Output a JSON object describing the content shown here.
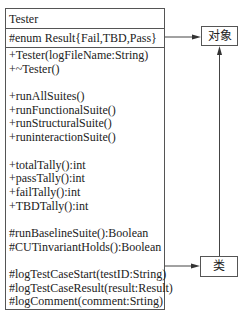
{
  "class_box": {
    "name": "Tester",
    "attributes": [
      "#enum Result{Fail,TBD,Pass}"
    ],
    "operation_groups": [
      [
        "+Tester(logFileName:String)",
        "+~Tester()"
      ],
      [
        "+runAllSuites()",
        "+runFunctionalSuite()",
        "+runStructuralSuite()",
        "+runinteractionSuite()"
      ],
      [
        "+totalTally():int",
        "+passTally():int",
        "+failTally():int",
        "+TBDTally():int"
      ],
      [
        "#runBaselineSuite():Boolean",
        "#CUTinvariantHolds():Boolean"
      ],
      [
        "#logTestCaseStart(testID:String)",
        "#logTestCaseResult(result:Result)",
        "#logComment(comment:Srting)"
      ]
    ]
  },
  "labels": {
    "object": "对象",
    "class": "类"
  },
  "colors": {
    "line": "#555555",
    "text": "#222222",
    "background": "#ffffff"
  }
}
